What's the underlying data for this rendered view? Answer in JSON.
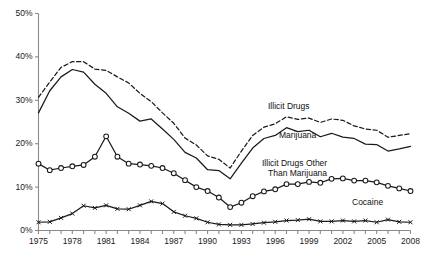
{
  "chart_data": {
    "type": "line",
    "title": "",
    "subtitle": "",
    "xlabel": "",
    "ylabel": "",
    "xlim": [
      1975,
      2008
    ],
    "ylim": [
      0,
      50
    ],
    "grid": false,
    "legend_position": "inline-annotations",
    "y_ticks": [
      0,
      10,
      20,
      30,
      40,
      50
    ],
    "y_tick_labels": [
      "0%",
      "10%",
      "20%",
      "30%",
      "40%",
      "50%"
    ],
    "x_ticks": [
      1975,
      1976,
      1977,
      1978,
      1979,
      1980,
      1981,
      1982,
      1983,
      1984,
      1985,
      1986,
      1987,
      1988,
      1989,
      1990,
      1991,
      1992,
      1993,
      1994,
      1995,
      1996,
      1997,
      1998,
      1999,
      2000,
      2001,
      2002,
      2003,
      2004,
      2005,
      2006,
      2007,
      2008
    ],
    "x_tick_labels": [
      "1975",
      "1978",
      "1981",
      "1984",
      "1987",
      "1990",
      "1993",
      "1996",
      "1999",
      "2002",
      "2005",
      "2008"
    ],
    "x_tick_label_years": [
      1975,
      1978,
      1981,
      1984,
      1987,
      1990,
      1993,
      1996,
      1999,
      2002,
      2005,
      2008
    ],
    "x": [
      1975,
      1976,
      1977,
      1978,
      1979,
      1980,
      1981,
      1982,
      1983,
      1984,
      1985,
      1986,
      1987,
      1988,
      1989,
      1990,
      1991,
      1992,
      1993,
      1994,
      1995,
      1996,
      1997,
      1998,
      1999,
      2000,
      2001,
      2002,
      2003,
      2004,
      2005,
      2006,
      2007,
      2008
    ],
    "series": [
      {
        "name": "Illicit Drugs",
        "style": "dashed",
        "marker": "none",
        "color": "#1a1a1a",
        "values": [
          30.7,
          34.2,
          37.6,
          38.9,
          38.9,
          37.2,
          36.9,
          35.4,
          34.0,
          31.6,
          29.7,
          27.1,
          24.7,
          21.3,
          19.7,
          17.2,
          16.4,
          14.4,
          18.3,
          21.9,
          23.8,
          24.6,
          26.2,
          25.6,
          25.9,
          24.9,
          25.7,
          25.4,
          24.1,
          23.4,
          23.1,
          21.5,
          21.9,
          22.3
        ]
      },
      {
        "name": "Marijuana",
        "style": "solid",
        "marker": "none",
        "color": "#1a1a1a",
        "values": [
          27.1,
          32.2,
          35.4,
          37.1,
          36.5,
          33.7,
          31.6,
          28.5,
          27.0,
          25.2,
          25.7,
          23.4,
          21.0,
          18.0,
          16.7,
          14.0,
          13.8,
          11.9,
          15.5,
          19.0,
          21.2,
          21.9,
          23.7,
          22.8,
          23.1,
          21.6,
          22.4,
          21.5,
          21.2,
          19.9,
          19.8,
          18.3,
          18.8,
          19.4
        ]
      },
      {
        "name": "Illicit Drugs Other Than Marijuana",
        "style": "solid",
        "marker": "circle",
        "color": "#1a1a1a",
        "values": [
          15.4,
          13.9,
          14.4,
          14.8,
          15.1,
          17.0,
          21.7,
          17.0,
          15.4,
          15.2,
          14.9,
          14.4,
          13.2,
          11.6,
          10.0,
          9.1,
          7.6,
          5.4,
          6.4,
          7.9,
          9.0,
          9.5,
          10.7,
          10.7,
          11.2,
          11.0,
          11.9,
          12.0,
          11.5,
          11.5,
          11.1,
          10.3,
          9.7,
          9.1
        ]
      },
      {
        "name": "Cocaine",
        "style": "solid",
        "marker": "x",
        "color": "#1a1a1a",
        "values": [
          1.9,
          2.0,
          2.9,
          3.9,
          5.7,
          5.2,
          5.8,
          5.0,
          4.9,
          5.8,
          6.7,
          6.2,
          4.3,
          3.4,
          2.8,
          1.9,
          1.4,
          1.3,
          1.3,
          1.5,
          1.8,
          2.0,
          2.3,
          2.4,
          2.6,
          2.1,
          2.1,
          2.3,
          2.1,
          2.3,
          1.9,
          2.5,
          2.0,
          1.9
        ]
      }
    ],
    "annotations": [
      {
        "name": "illicit-drugs-label",
        "text": "Illicit Drugs",
        "x": 268,
        "y": 101
      },
      {
        "name": "marijuana-label",
        "text": "Marijuana",
        "x": 279,
        "y": 130
      },
      {
        "name": "other-label-line1",
        "text": "Illicit Drugs Other",
        "x": 262,
        "y": 158
      },
      {
        "name": "other-label-line2",
        "text": "Than Marijuana",
        "x": 268,
        "y": 168
      },
      {
        "name": "cocaine-label",
        "text": "Cocaine",
        "x": 352,
        "y": 197
      }
    ],
    "axis_color": "#8a8a8a",
    "line_color": "#1a1a1a",
    "background": "#ffffff"
  }
}
